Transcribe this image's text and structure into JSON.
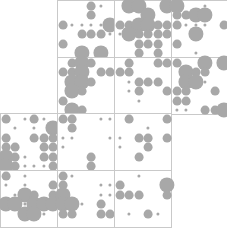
{
  "figure": {
    "title": "",
    "background_color": "#ffffff",
    "grid_line_color": "#c9c9c9",
    "dot_color": "#a8a8a8",
    "width": 227,
    "height": 231
  },
  "chart_data": {
    "type": "scatter",
    "title": "",
    "subtitle": "",
    "xlabel": "",
    "ylabel": "",
    "grid": true,
    "legend": null,
    "panel_size": 57,
    "panel_lattice": 6,
    "size_scale": {
      "0": 0,
      "1": 1.6,
      "2": 3.0,
      "3": 4.4,
      "4": 6.0,
      "5": 7.6
    },
    "panels": [
      {
        "name": "panel-r0c1",
        "row": 0,
        "col": 1,
        "x": 57,
        "y": 0,
        "values": [
          [
            0,
            0,
            0,
            3,
            1,
            0
          ],
          [
            0,
            0,
            0,
            3,
            0,
            0
          ],
          [
            3,
            1,
            1,
            1,
            1,
            5
          ],
          [
            0,
            0,
            3,
            3,
            3,
            1
          ],
          [
            3,
            0,
            0,
            0,
            0,
            0
          ],
          [
            0,
            0,
            5,
            0,
            5,
            0
          ]
        ]
      },
      {
        "name": "panel-r0c2",
        "row": 0,
        "col": 2,
        "x": 114,
        "y": 0,
        "values": [
          [
            0,
            5,
            5,
            0,
            0,
            5
          ],
          [
            0,
            0,
            0,
            5,
            0,
            0
          ],
          [
            3,
            3,
            5,
            5,
            3,
            3
          ],
          [
            1,
            5,
            3,
            3,
            3,
            3
          ],
          [
            0,
            0,
            3,
            3,
            3,
            0
          ],
          [
            0,
            0,
            3,
            0,
            3,
            0
          ]
        ]
      },
      {
        "name": "panel-r0c3",
        "row": 0,
        "col": 3,
        "x": 171,
        "y": 0,
        "values": [
          [
            5,
            0,
            0,
            1,
            0,
            0
          ],
          [
            3,
            3,
            5,
            5,
            0,
            0
          ],
          [
            3,
            1,
            1,
            1,
            0,
            3
          ],
          [
            0,
            0,
            5,
            0,
            0,
            0
          ],
          [
            3,
            0,
            0,
            0,
            0,
            0
          ],
          [
            0,
            0,
            1,
            0,
            0,
            0
          ]
        ]
      },
      {
        "name": "panel-r1c1",
        "row": 1,
        "col": 1,
        "x": 57,
        "y": 57,
        "values": [
          [
            0,
            3,
            5,
            3,
            0,
            0
          ],
          [
            3,
            3,
            5,
            0,
            3,
            3
          ],
          [
            0,
            5,
            5,
            3,
            0,
            0
          ],
          [
            0,
            5,
            3,
            0,
            0,
            0
          ],
          [
            3,
            0,
            0,
            0,
            0,
            0
          ],
          [
            0,
            5,
            3,
            0,
            0,
            0
          ]
        ]
      },
      {
        "name": "panel-r1c2",
        "row": 1,
        "col": 2,
        "x": 114,
        "y": 57,
        "values": [
          [
            0,
            3,
            0,
            0,
            3,
            3
          ],
          [
            3,
            3,
            0,
            0,
            0,
            0
          ],
          [
            0,
            1,
            3,
            3,
            3,
            0
          ],
          [
            0,
            1,
            3,
            0,
            0,
            3
          ],
          [
            0,
            0,
            1,
            0,
            0,
            0
          ],
          [
            0,
            0,
            0,
            0,
            0,
            0
          ]
        ]
      },
      {
        "name": "panel-r1c3",
        "row": 1,
        "col": 3,
        "x": 171,
        "y": 57,
        "values": [
          [
            3,
            0,
            0,
            5,
            0,
            5
          ],
          [
            0,
            5,
            3,
            3,
            0,
            0
          ],
          [
            0,
            5,
            5,
            1,
            0,
            0
          ],
          [
            3,
            3,
            0,
            0,
            3,
            0
          ],
          [
            3,
            3,
            0,
            0,
            0,
            0
          ],
          [
            1,
            1,
            0,
            3,
            3,
            5
          ]
        ]
      },
      {
        "name": "panel-r2c0",
        "row": 2,
        "col": 0,
        "x": 0,
        "y": 113,
        "values": [
          [
            3,
            0,
            1,
            3,
            1,
            0
          ],
          [
            0,
            1,
            0,
            1,
            0,
            5
          ],
          [
            3,
            0,
            0,
            3,
            3,
            3
          ],
          [
            3,
            3,
            0,
            0,
            3,
            3
          ],
          [
            5,
            3,
            1,
            0,
            3,
            3
          ],
          [
            5,
            3,
            1,
            1,
            1,
            3
          ]
        ]
      },
      {
        "name": "panel-r2c1",
        "row": 2,
        "col": 1,
        "x": 57,
        "y": 113,
        "values": [
          [
            3,
            3,
            0,
            0,
            1,
            1
          ],
          [
            0,
            3,
            0,
            0,
            0,
            0
          ],
          [
            1,
            1,
            0,
            0,
            0,
            1
          ],
          [
            1,
            0,
            0,
            0,
            0,
            0
          ],
          [
            0,
            0,
            0,
            3,
            0,
            0
          ],
          [
            0,
            0,
            0,
            3,
            0,
            0
          ]
        ]
      },
      {
        "name": "panel-r2c2",
        "row": 2,
        "col": 2,
        "x": 114,
        "y": 113,
        "values": [
          [
            0,
            3,
            0,
            0,
            0,
            3
          ],
          [
            0,
            0,
            0,
            1,
            0,
            0
          ],
          [
            1,
            0,
            3,
            3,
            0,
            3
          ],
          [
            1,
            0,
            0,
            3,
            0,
            0
          ],
          [
            0,
            0,
            3,
            0,
            0,
            0
          ],
          [
            0,
            0,
            0,
            0,
            0,
            0
          ]
        ]
      },
      {
        "name": "panel-r3c0",
        "row": 3,
        "col": 0,
        "x": 0,
        "y": 170,
        "values": [
          [
            3,
            0,
            1,
            0,
            0,
            0
          ],
          [
            1,
            0,
            1,
            0,
            0,
            3
          ],
          [
            0,
            1,
            5,
            3,
            0,
            3
          ],
          [
            5,
            5,
            1,
            5,
            5,
            5
          ],
          [
            0,
            0,
            5,
            5,
            1,
            0
          ],
          [
            0,
            0,
            0,
            0,
            0,
            0
          ]
        ]
      },
      {
        "name": "panel-r3c1",
        "row": 3,
        "col": 1,
        "x": 57,
        "y": 170,
        "values": [
          [
            3,
            1,
            0,
            0,
            0,
            0
          ],
          [
            3,
            0,
            0,
            0,
            1,
            1
          ],
          [
            5,
            0,
            0,
            0,
            1,
            1
          ],
          [
            5,
            5,
            1,
            0,
            3,
            0
          ],
          [
            3,
            3,
            0,
            0,
            3,
            3
          ],
          [
            0,
            0,
            0,
            0,
            0,
            0
          ]
        ]
      },
      {
        "name": "panel-r3c2",
        "row": 3,
        "col": 2,
        "x": 114,
        "y": 170,
        "values": [
          [
            0,
            0,
            1,
            0,
            0,
            0
          ],
          [
            3,
            0,
            0,
            0,
            0,
            5
          ],
          [
            3,
            3,
            3,
            0,
            0,
            3
          ],
          [
            0,
            0,
            0,
            0,
            0,
            0
          ],
          [
            0,
            1,
            0,
            3,
            1,
            0
          ],
          [
            0,
            0,
            0,
            0,
            0,
            0
          ]
        ]
      }
    ]
  }
}
